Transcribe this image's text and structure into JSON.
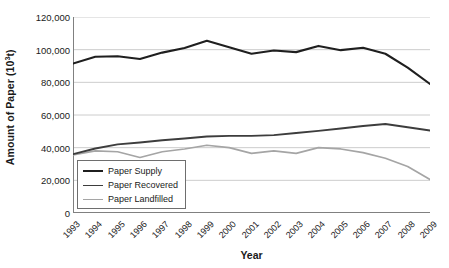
{
  "chart_data": {
    "type": "line",
    "title": "",
    "xlabel": "Year",
    "ylabel": "Amount of Paper (10³t)",
    "ylabel_base": "Amount of Paper (10",
    "ylabel_sup": "3",
    "ylabel_tail": "t)",
    "categories": [
      1993,
      1994,
      1995,
      1996,
      1997,
      1998,
      1999,
      2000,
      2001,
      2002,
      2003,
      2004,
      2005,
      2006,
      2007,
      2008,
      2009
    ],
    "x": [
      "1993",
      "1994",
      "1995",
      "1996",
      "1997",
      "1998",
      "1999",
      "2000",
      "2001",
      "2002",
      "2003",
      "2004",
      "2005",
      "2006",
      "2007",
      "2008",
      "2009"
    ],
    "ylim": [
      0,
      120000
    ],
    "ytick_values": [
      0,
      20000,
      40000,
      60000,
      80000,
      100000,
      120000
    ],
    "ytick_labels": [
      "0",
      "20,000",
      "40,000",
      "60,000",
      "80,000",
      "100,000",
      "120,000"
    ],
    "grid": true,
    "legend_position": "lower-left-inside",
    "series": [
      {
        "name": "Paper Supply",
        "color": "#1f1f1f",
        "width": 2.1,
        "values": [
          91500,
          95700,
          96000,
          94300,
          98200,
          101000,
          105500,
          101500,
          97500,
          99500,
          98500,
          102300,
          99700,
          101200,
          97500,
          89000,
          79000
        ]
      },
      {
        "name": "Paper Recovered",
        "color": "#3d3d3d",
        "width": 1.9,
        "values": [
          36000,
          39500,
          42000,
          43200,
          44500,
          45600,
          46800,
          47200,
          47200,
          47700,
          49000,
          50300,
          51700,
          53300,
          54500,
          52500,
          50500
        ]
      },
      {
        "name": "Paper Landfilled",
        "color": "#a5a5a5",
        "width": 1.7,
        "values": [
          35500,
          38000,
          37500,
          34000,
          37500,
          39200,
          41500,
          40000,
          36500,
          38000,
          36500,
          40000,
          39200,
          37000,
          33500,
          28500,
          20500
        ]
      }
    ]
  },
  "legend": {
    "items": [
      {
        "label": "Paper Supply",
        "color": "#1f1f1f"
      },
      {
        "label": "Paper Recovered",
        "color": "#3d3d3d"
      },
      {
        "label": "Paper Landfilled",
        "color": "#a5a5a5"
      }
    ]
  },
  "axes": {
    "axis_color": "#808080",
    "grid_color": "#bfbfbf",
    "text_color": "#1a1a1a"
  }
}
